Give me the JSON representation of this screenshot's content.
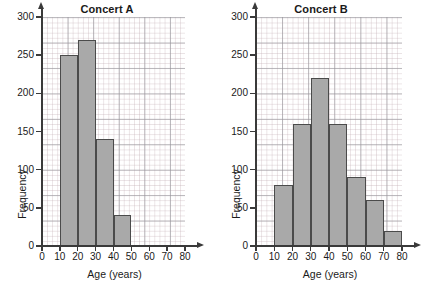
{
  "figure": {
    "background": "#ffffff",
    "bar_fill": "#a9a9a9",
    "bar_stroke": "#4b4b4b",
    "axis_color": "#3a3a3a",
    "grid_minor_color": "#c4b0b6",
    "grid_major_color": "#96969c"
  },
  "panels": [
    {
      "key": "concert_a",
      "title": "Concert A",
      "xlabel": "Age (years)",
      "ylabel": "Frequency",
      "xticks": [
        "0",
        "10",
        "20",
        "30",
        "40",
        "50",
        "60",
        "70",
        "80"
      ],
      "yticks": [
        "0",
        "50",
        "100",
        "150",
        "200",
        "250",
        "300"
      ]
    },
    {
      "key": "concert_b",
      "title": "Concert B",
      "xlabel": "Age (years)",
      "ylabel": "Frequency",
      "xticks": [
        "0",
        "10",
        "20",
        "30",
        "40",
        "50",
        "60",
        "70",
        "80"
      ],
      "yticks": [
        "0",
        "50",
        "100",
        "150",
        "200",
        "250",
        "300"
      ]
    }
  ],
  "chart_data": [
    {
      "type": "bar",
      "title": "Concert A",
      "xlabel": "Age (years)",
      "ylabel": "Frequency",
      "xlim": [
        0,
        80
      ],
      "ylim": [
        0,
        300
      ],
      "xticks": [
        0,
        10,
        20,
        30,
        40,
        50,
        60,
        70,
        80
      ],
      "yticks": [
        0,
        50,
        100,
        150,
        200,
        250,
        300
      ],
      "grid": true,
      "legend": "none",
      "bin_edges": [
        10,
        20,
        30,
        40,
        50
      ],
      "categories": [
        "10-20",
        "20-30",
        "30-40",
        "40-50"
      ],
      "values": [
        250,
        270,
        140,
        40
      ]
    },
    {
      "type": "bar",
      "title": "Concert B",
      "xlabel": "Age (years)",
      "ylabel": "Frequency",
      "xlim": [
        0,
        80
      ],
      "ylim": [
        0,
        300
      ],
      "xticks": [
        0,
        10,
        20,
        30,
        40,
        50,
        60,
        70,
        80
      ],
      "yticks": [
        0,
        50,
        100,
        150,
        200,
        250,
        300
      ],
      "grid": true,
      "legend": "none",
      "bin_edges": [
        10,
        20,
        30,
        40,
        50,
        60,
        70,
        80
      ],
      "categories": [
        "10-20",
        "20-30",
        "30-40",
        "40-50",
        "50-60",
        "60-70",
        "70-80"
      ],
      "values": [
        80,
        160,
        220,
        160,
        90,
        60,
        20
      ]
    }
  ]
}
